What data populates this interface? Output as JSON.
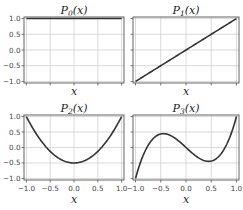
{
  "chart_data": [
    {
      "type": "line",
      "title": "P_0(x)",
      "title_display": "P0(x)",
      "xlabel": "x",
      "ylabel": "",
      "xlim": [
        -1.05,
        1.05
      ],
      "ylim": [
        -1.05,
        1.05
      ],
      "xticks": [
        -1.0,
        -0.5,
        0.0,
        0.5,
        1.0
      ],
      "yticks": [
        -1.0,
        -0.5,
        0.0,
        0.5,
        1.0
      ],
      "xticklabels_visible": false,
      "yticklabels_visible": true,
      "grid": true,
      "function": "1",
      "x": [
        -1.0,
        -0.5,
        0.0,
        0.5,
        1.0
      ],
      "y": [
        1.0,
        1.0,
        1.0,
        1.0,
        1.0
      ]
    },
    {
      "type": "line",
      "title": "P_1(x)",
      "title_display": "P1(x)",
      "xlabel": "x",
      "ylabel": "",
      "xlim": [
        -1.05,
        1.05
      ],
      "ylim": [
        -1.05,
        1.05
      ],
      "xticks": [
        -1.0,
        -0.5,
        0.0,
        0.5,
        1.0
      ],
      "yticks": [
        -1.0,
        -0.5,
        0.0,
        0.5,
        1.0
      ],
      "xticklabels_visible": false,
      "yticklabels_visible": false,
      "grid": true,
      "function": "x",
      "x": [
        -1.0,
        -0.5,
        0.0,
        0.5,
        1.0
      ],
      "y": [
        -1.0,
        -0.5,
        0.0,
        0.5,
        1.0
      ]
    },
    {
      "type": "line",
      "title": "P_2(x)",
      "title_display": "P2(x)",
      "xlabel": "x",
      "ylabel": "",
      "xlim": [
        -1.05,
        1.05
      ],
      "ylim": [
        -1.05,
        1.05
      ],
      "xticks": [
        -1.0,
        -0.5,
        0.0,
        0.5,
        1.0
      ],
      "yticks": [
        -1.0,
        -0.5,
        0.0,
        0.5,
        1.0
      ],
      "xticklabels_visible": true,
      "yticklabels_visible": true,
      "grid": true,
      "function": "(3x^2-1)/2",
      "x": [
        -1.0,
        -0.75,
        -0.5,
        -0.25,
        0.0,
        0.25,
        0.5,
        0.75,
        1.0
      ],
      "y": [
        1.0,
        0.344,
        -0.125,
        -0.406,
        -0.5,
        -0.406,
        -0.125,
        0.344,
        1.0
      ]
    },
    {
      "type": "line",
      "title": "P_3(x)",
      "title_display": "P3(x)",
      "xlabel": "x",
      "ylabel": "",
      "xlim": [
        -1.05,
        1.05
      ],
      "ylim": [
        -1.05,
        1.05
      ],
      "xticks": [
        -1.0,
        -0.5,
        0.0,
        0.5,
        1.0
      ],
      "yticks": [
        -1.0,
        -0.5,
        0.0,
        0.5,
        1.0
      ],
      "xticklabels_visible": true,
      "yticklabels_visible": false,
      "grid": true,
      "function": "(5x^3-3x)/2",
      "x": [
        -1.0,
        -0.75,
        -0.5,
        -0.25,
        0.0,
        0.25,
        0.5,
        0.75,
        1.0
      ],
      "y": [
        -1.0,
        0.07,
        0.4375,
        0.336,
        0.0,
        -0.336,
        -0.4375,
        -0.07,
        1.0
      ]
    }
  ],
  "labels": {
    "xticks": [
      "−1.0",
      "−0.5",
      "0.0",
      "0.5",
      "1.0"
    ],
    "yticks": [
      "1.0",
      "0.5",
      "0.0",
      "−0.5",
      "−1.0"
    ],
    "xlabel": "x",
    "titles": [
      "P",
      "P",
      "P",
      "P"
    ],
    "subscripts": [
      "0",
      "1",
      "2",
      "3"
    ],
    "title_suffix": "(x)"
  },
  "colors": {
    "line": "#333333",
    "grid": "#cfcfcf",
    "spine": "#555555",
    "background": "#ffffff"
  }
}
